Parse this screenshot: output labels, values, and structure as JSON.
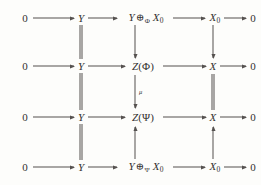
{
  "diagram": {
    "kind": "commutative-diagram",
    "stroke_color": "#55514f",
    "text_color": "#333030",
    "background_color": "#fdfdfb",
    "rows": [
      {
        "id": "row-1",
        "nodes": [
          "0",
          "Y",
          "Y ⊕Φ X0",
          "X0",
          "0"
        ],
        "node_labels": {
          "n0": "0",
          "n1": "Y",
          "n2_left": "Y",
          "n2_oplus": "⊕",
          "n2_sub": "Φ",
          "n2_right": "X",
          "n2_right_sub": "0",
          "n3": "X",
          "n3_sub": "0",
          "n4": "0"
        }
      },
      {
        "id": "row-2",
        "nodes": [
          "0",
          "Y",
          "Z(Φ)",
          "X",
          "0"
        ],
        "node_labels": {
          "n0": "0",
          "n1": "Y",
          "n2_fn": "Z",
          "n2_arg": "(Φ)",
          "n3": "X",
          "n4": "0"
        }
      },
      {
        "id": "row-3",
        "nodes": [
          "0",
          "Y",
          "Z(Ψ)",
          "X",
          "0"
        ],
        "node_labels": {
          "n0": "0",
          "n1": "Y",
          "n2_fn": "Z",
          "n2_arg": "(Ψ)",
          "n3": "X",
          "n4": "0"
        }
      },
      {
        "id": "row-4",
        "nodes": [
          "0",
          "Y",
          "Y ⊕Ψ X0",
          "X0",
          "0"
        ],
        "node_labels": {
          "n0": "0",
          "n1": "Y",
          "n2_left": "Y",
          "n2_oplus": "⊕",
          "n2_sub": "Ψ",
          "n2_right": "X",
          "n2_right_sub": "0",
          "n3": "X",
          "n3_sub": "0",
          "n4": "0"
        }
      }
    ],
    "arrow_labels": {
      "mu": "μ"
    },
    "vertical_morphisms": [
      {
        "id": "col2-r1-r2",
        "type": "equality",
        "column": "Y"
      },
      {
        "id": "col2-r2-r3",
        "type": "equality",
        "column": "Y"
      },
      {
        "id": "col2-r3-r4",
        "type": "equality",
        "column": "Y"
      },
      {
        "id": "col3-r1-r2",
        "type": "arrow-down",
        "column": "middle"
      },
      {
        "id": "col3-r2-r3",
        "type": "arrow-down",
        "column": "middle",
        "label": "μ"
      },
      {
        "id": "col3-r4-r3",
        "type": "arrow-up",
        "column": "middle"
      },
      {
        "id": "col4-r1-r2",
        "type": "arrow-down",
        "column": "X"
      },
      {
        "id": "col4-r2-r3",
        "type": "equality",
        "column": "X"
      },
      {
        "id": "col4-r4-r3",
        "type": "arrow-up",
        "column": "X"
      }
    ]
  }
}
